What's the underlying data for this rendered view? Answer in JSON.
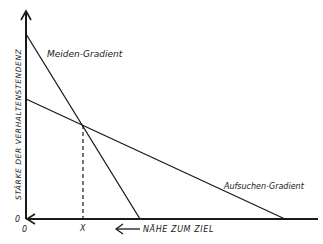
{
  "diagram": {
    "y_axis_label": "STÄRKE DER VERHALTENSTENDENZ",
    "x_axis_label": "NÄHE ZUM ZIEL",
    "origin_y": "0",
    "origin_x": "0",
    "intersection_label": "X",
    "lines": [
      {
        "name": "Meiden-Gradient",
        "label": "Meiden-Gradient"
      },
      {
        "name": "Aufsuchen-Gradient",
        "label": "Aufsuchen-Gradient"
      }
    ],
    "color": "#1a1a1a"
  }
}
